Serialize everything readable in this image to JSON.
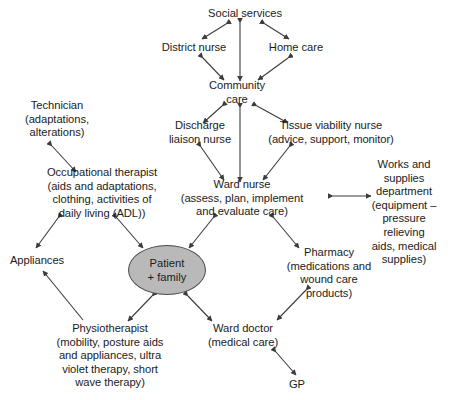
{
  "diagram": {
    "colors": {
      "background": "#ffffff",
      "text": "#1b1b1b",
      "edge": "#3c3c3c",
      "patient_fill": "#b9b9b9",
      "patient_stroke": "#4a4a4a"
    },
    "nodes": [
      {
        "id": "social_services",
        "label": "Social services",
        "x": 245,
        "y": 14,
        "lines": 1
      },
      {
        "id": "district_nurse",
        "label": "District nurse",
        "x": 194,
        "y": 48,
        "lines": 1
      },
      {
        "id": "home_care",
        "label": "Home care",
        "x": 296,
        "y": 48,
        "lines": 1
      },
      {
        "id": "community_care",
        "label": "Community\ncare",
        "x": 237,
        "y": 93,
        "lines": 2
      },
      {
        "id": "technician",
        "label": "Technician\n(adaptations,\nalterations)",
        "x": 57,
        "y": 119,
        "lines": 3
      },
      {
        "id": "discharge_liaison",
        "label": "Discharge\nliaison nurse",
        "x": 200,
        "y": 133,
        "lines": 2
      },
      {
        "id": "tissue_viability",
        "label": "Tissue viability nurse\n(advice, support, monitor)",
        "x": 331,
        "y": 133,
        "lines": 2
      },
      {
        "id": "occupational",
        "label": "Occupational therapist\n(aids and adaptations,\nclothing, activities of\ndaily living (ADL))",
        "x": 102,
        "y": 193,
        "lines": 4
      },
      {
        "id": "ward_nurse",
        "label": "Ward nurse\n(assess, plan, implement\nand evaluate care)",
        "x": 242,
        "y": 198,
        "lines": 3
      },
      {
        "id": "works_supplies",
        "label": "Works and supplies\ndepartment\n(equipment – pressure\nrelieving aids, medical\nsupplies)",
        "x": 404,
        "y": 212,
        "lines": 5
      },
      {
        "id": "appliances",
        "label": "Appliances",
        "x": 37,
        "y": 261,
        "lines": 1
      },
      {
        "id": "pharmacy",
        "label": "Pharmacy\n(medications and\nwound care\nproducts)",
        "x": 329,
        "y": 273,
        "lines": 4
      },
      {
        "id": "physiotherapist",
        "label": "Physiotherapist\n(mobility, posture aids\nand appliances, ultra\nviolet therapy, short\nwave therapy)",
        "x": 110,
        "y": 356,
        "lines": 5
      },
      {
        "id": "ward_doctor",
        "label": "Ward doctor\n(medical care)",
        "x": 243,
        "y": 336,
        "lines": 2
      },
      {
        "id": "gp",
        "label": "GP",
        "x": 297,
        "y": 385,
        "lines": 1
      }
    ],
    "patient_node": {
      "id": "patient_family",
      "label": "Patient\n+ family",
      "x": 167,
      "y": 270,
      "width": 78,
      "height": 50
    },
    "edges": [
      {
        "id": "e-social-district",
        "from": "social_services",
        "to": "district_nurse",
        "x1": 226,
        "y1": 24,
        "x2": 202,
        "y2": 39,
        "arrows": "both"
      },
      {
        "id": "e-social-home",
        "from": "social_services",
        "to": "home_care",
        "x1": 265,
        "y1": 24,
        "x2": 289,
        "y2": 39,
        "arrows": "both"
      },
      {
        "id": "e-social-community",
        "from": "social_services",
        "to": "community_care",
        "x1": 240,
        "y1": 23,
        "x2": 240,
        "y2": 81,
        "arrows": "both"
      },
      {
        "id": "e-district-community",
        "from": "district_nurse",
        "to": "community_care",
        "x1": 203,
        "y1": 58,
        "x2": 224,
        "y2": 80,
        "arrows": "both"
      },
      {
        "id": "e-home-community",
        "from": "home_care",
        "to": "community_care",
        "x1": 288,
        "y1": 58,
        "x2": 258,
        "y2": 80,
        "arrows": "both"
      },
      {
        "id": "e-community-discharge",
        "from": "community_care",
        "to": "discharge_liaison",
        "x1": 222,
        "y1": 106,
        "x2": 203,
        "y2": 123,
        "arrows": "both"
      },
      {
        "id": "e-community-tissue",
        "from": "community_care",
        "to": "tissue_viability",
        "x1": 257,
        "y1": 106,
        "x2": 288,
        "y2": 123,
        "arrows": "both"
      },
      {
        "id": "e-community-ward",
        "from": "community_care",
        "to": "ward_nurse",
        "x1": 240,
        "y1": 108,
        "x2": 240,
        "y2": 182,
        "arrows": "both"
      },
      {
        "id": "e-discharge-ward",
        "from": "discharge_liaison",
        "to": "ward_nurse",
        "x1": 201,
        "y1": 147,
        "x2": 224,
        "y2": 180,
        "arrows": "both"
      },
      {
        "id": "e-tissue-ward",
        "from": "tissue_viability",
        "to": "ward_nurse",
        "x1": 289,
        "y1": 147,
        "x2": 263,
        "y2": 180,
        "arrows": "both"
      },
      {
        "id": "e-ward-works",
        "from": "ward_nurse",
        "to": "works_supplies",
        "x1": 333,
        "y1": 196,
        "x2": 371,
        "y2": 196,
        "arrows": "both"
      },
      {
        "id": "e-technician-ot",
        "from": "technician",
        "to": "occupational",
        "x1": 52,
        "y1": 146,
        "x2": 76,
        "y2": 172,
        "arrows": "both"
      },
      {
        "id": "e-ot-appliances",
        "from": "occupational",
        "to": "appliances",
        "x1": 58,
        "y1": 218,
        "x2": 36,
        "y2": 248,
        "arrows": "both"
      },
      {
        "id": "e-ot-patient",
        "from": "occupational",
        "to": "patient_family",
        "x1": 117,
        "y1": 218,
        "x2": 143,
        "y2": 248,
        "arrows": "both"
      },
      {
        "id": "e-ward-patient",
        "from": "ward_nurse",
        "to": "patient_family",
        "x1": 213,
        "y1": 218,
        "x2": 189,
        "y2": 248,
        "arrows": "both"
      },
      {
        "id": "e-ward-pharmacy",
        "from": "ward_nurse",
        "to": "pharmacy",
        "x1": 274,
        "y1": 218,
        "x2": 299,
        "y2": 248,
        "arrows": "both"
      },
      {
        "id": "e-physio-appliances",
        "from": "physiotherapist",
        "to": "appliances",
        "x1": 83,
        "y1": 320,
        "x2": 43,
        "y2": 271,
        "arrows": "single-end"
      },
      {
        "id": "e-patient-physio",
        "from": "patient_family",
        "to": "physiotherapist",
        "x1": 152,
        "y1": 296,
        "x2": 128,
        "y2": 321,
        "arrows": "both"
      },
      {
        "id": "e-patient-warddoc",
        "from": "patient_family",
        "to": "ward_doctor",
        "x1": 188,
        "y1": 296,
        "x2": 212,
        "y2": 321,
        "arrows": "both"
      },
      {
        "id": "e-pharmacy-warddoc",
        "from": "pharmacy",
        "to": "ward_doctor",
        "x1": 306,
        "y1": 290,
        "x2": 277,
        "y2": 320,
        "arrows": "both"
      },
      {
        "id": "e-warddoc-gp",
        "from": "ward_doctor",
        "to": "gp",
        "x1": 276,
        "y1": 352,
        "x2": 296,
        "y2": 375,
        "arrows": "both"
      }
    ]
  }
}
